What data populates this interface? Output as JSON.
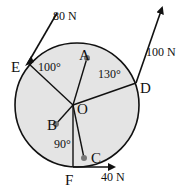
{
  "diagram": {
    "title": "",
    "disc": {
      "fill": "#e4e4e4",
      "stroke": "#111111"
    },
    "points": {
      "A": "A",
      "B": "B",
      "C": "C",
      "D": "D",
      "E": "E",
      "F": "F",
      "O": "O"
    },
    "forces": [
      {
        "id": "E",
        "label": "80 N"
      },
      {
        "id": "D",
        "label": "100 N"
      },
      {
        "id": "F",
        "label": "40 N"
      }
    ],
    "angles": [
      {
        "at": "E",
        "label": "100°"
      },
      {
        "at": "D",
        "label": "130°"
      },
      {
        "at": "F",
        "label": "90°"
      }
    ]
  }
}
